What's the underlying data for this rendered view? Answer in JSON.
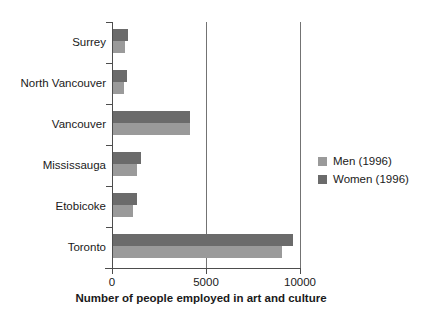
{
  "chart_data": {
    "type": "bar",
    "orientation": "horizontal",
    "title": "",
    "xlabel": "Number of people employed in art and culture",
    "ylabel": "",
    "categories": [
      "Surrey",
      "North Vancouver",
      "Vancouver",
      "Mississauga",
      "Etobicoke",
      "Toronto"
    ],
    "series": [
      {
        "name": "Men (1996)",
        "color": "#9a9a9a",
        "values": [
          650,
          600,
          4100,
          1300,
          1050,
          9000
        ]
      },
      {
        "name": "Women (1996)",
        "color": "#6b6b6b",
        "values": [
          800,
          750,
          4100,
          1500,
          1250,
          9600
        ]
      }
    ],
    "xlim": [
      0,
      10000
    ],
    "xticks": [
      0,
      5000,
      10000
    ],
    "xtick_labels": [
      "0",
      "5000",
      "10000"
    ],
    "grid": "vertical-at-5000-and-10000",
    "legend_position": "right-middle"
  },
  "legend": {
    "entries": [
      {
        "label": "Men (1996)",
        "color": "#9a9a9a"
      },
      {
        "label": "Women (1996)",
        "color": "#6b6b6b"
      }
    ]
  },
  "axis": {
    "x_title": "Number of people employed in art and culture",
    "tick_labels": [
      "0",
      "5000",
      "10000"
    ],
    "category_labels": [
      "Surrey",
      "North Vancouver",
      "Vancouver",
      "Mississauga",
      "Etobicoke",
      "Toronto"
    ]
  },
  "colors": {
    "men": "#9a9a9a",
    "women": "#6b6b6b",
    "axis": "#4d4d4d",
    "grid": "#737373",
    "text": "#1a1a1a",
    "background": "#ffffff"
  }
}
